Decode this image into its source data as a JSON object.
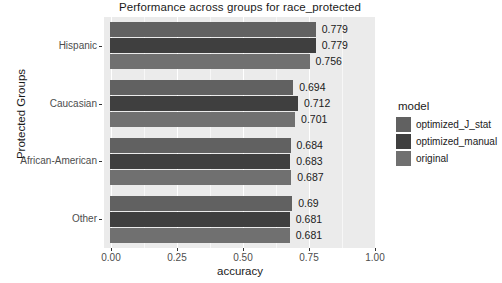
{
  "chart_data": {
    "type": "bar",
    "orientation": "horizontal",
    "title": "Performance across groups for race_protected",
    "xlabel": "accuracy",
    "ylabel": "Protected Groups",
    "categories": [
      "Hispanic",
      "Caucasian",
      "African-American",
      "Other"
    ],
    "xlim": [
      0.0,
      1.0
    ],
    "xticks": [
      "0.00",
      "0.25",
      "0.50",
      "0.75",
      "1.00"
    ],
    "xtick_values": [
      0.0,
      0.25,
      0.5,
      0.75,
      1.0
    ],
    "grid": true,
    "legend_position": "right",
    "legend_title": "model",
    "series": [
      {
        "name": "optimized_J_stat",
        "color": "#616161",
        "values": [
          0.779,
          0.694,
          0.684,
          0.69
        ],
        "labels": [
          "0.779",
          "0.694",
          "0.684",
          "0.69"
        ]
      },
      {
        "name": "optimized_manual",
        "color": "#3f3f3f",
        "values": [
          0.779,
          0.712,
          0.683,
          0.681
        ],
        "labels": [
          "0.779",
          "0.712",
          "0.683",
          "0.681"
        ]
      },
      {
        "name": "original",
        "color": "#707070",
        "values": [
          0.756,
          0.701,
          0.687,
          0.681
        ],
        "labels": [
          "0.756",
          "0.701",
          "0.687",
          "0.681"
        ]
      }
    ],
    "panel_background": "#ebebeb",
    "gridline_color": "#ffffff"
  }
}
